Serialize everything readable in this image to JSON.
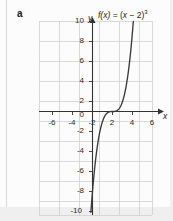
{
  "figure": {
    "part_label": "a",
    "title_prefix": "f(x)",
    "title_equals": " = (",
    "title_var": "x",
    "title_mid": " − 2)",
    "title_exp": "3",
    "title_plain": "f(x) = (x − 2)³",
    "axis_x_name": "x",
    "axis_y_name": "y",
    "curve_color": "#3a3a3a",
    "axis_color": "#333333",
    "grid_color": "#cfcfcf",
    "background_color": "#fcfcfc"
  },
  "chart_data": {
    "type": "line",
    "xlabel": "x",
    "ylabel": "y",
    "xlim": [
      -6.8,
      6.8
    ],
    "ylim": [
      -10.8,
      10.8
    ],
    "xticks": [
      -6,
      -4,
      -2,
      0,
      2,
      4,
      6
    ],
    "xtick_labels": [
      "-6",
      "-4",
      "-2",
      "0",
      "2",
      "4",
      "6"
    ],
    "yticks": [
      10,
      8,
      6,
      4,
      2,
      0,
      -2,
      -4,
      -6,
      -8,
      -10
    ],
    "ytick_labels": [
      "10",
      "8",
      "6",
      "4",
      "2",
      "0",
      "-2",
      "-4",
      "-6",
      "-8",
      "-10"
    ],
    "grid": true,
    "grid_spacing": 2,
    "legend": null,
    "series": [
      {
        "name": "f(x) = (x - 2)^3",
        "equation": "y = (x - 2)^3",
        "inflection_point": [
          2,
          0
        ],
        "x": [
          -0.154,
          0.0,
          0.2,
          0.4,
          0.6,
          0.8,
          1.0,
          1.2,
          1.4,
          1.6,
          1.8,
          2.0,
          2.2,
          2.4,
          2.6,
          2.8,
          3.0,
          3.2,
          3.4,
          3.6,
          3.8,
          4.0,
          4.154
        ],
        "y": [
          -10.0,
          -8.0,
          -5.832,
          -4.096,
          -2.744,
          -1.728,
          -1.0,
          -0.512,
          -0.216,
          -0.064,
          -0.008,
          0.0,
          0.008,
          0.064,
          0.216,
          0.512,
          1.0,
          1.728,
          2.744,
          4.096,
          5.832,
          8.0,
          10.0
        ]
      }
    ]
  }
}
